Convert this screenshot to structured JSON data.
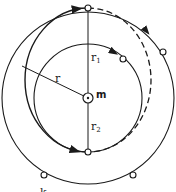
{
  "diagram": {
    "type": "orbital-transfer",
    "center_label": "m",
    "labels": {
      "r": "r",
      "r1": "r",
      "r1_sub": "1",
      "r2": "r",
      "r2_sub": "2"
    },
    "bottom_fragment": "k",
    "colors": {
      "stroke": "#1a1a1a",
      "background": "#ffffff"
    },
    "elements": [
      {
        "name": "outer-circle",
        "style": "solid"
      },
      {
        "name": "inner-circle",
        "style": "solid"
      },
      {
        "name": "transfer-ellipse-left",
        "style": "solid"
      },
      {
        "name": "transfer-ellipse-right",
        "style": "dashed"
      },
      {
        "name": "radius-line-r",
        "style": "solid"
      },
      {
        "name": "vertical-axis",
        "style": "solid"
      }
    ]
  }
}
